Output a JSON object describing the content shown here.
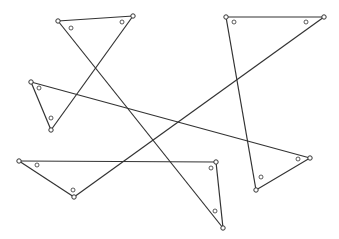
{
  "diagram": {
    "stroke_color": "#333333",
    "background": "#ffffff",
    "vertices": [
      {
        "id": "A",
        "x": 58,
        "y": 21
      },
      {
        "id": "B",
        "x": 133,
        "y": 16
      },
      {
        "id": "C",
        "x": 51,
        "y": 130
      },
      {
        "id": "D",
        "x": 31,
        "y": 82
      },
      {
        "id": "E",
        "x": 310,
        "y": 158
      },
      {
        "id": "F",
        "x": 19,
        "y": 161
      },
      {
        "id": "G",
        "x": 216,
        "y": 162
      },
      {
        "id": "H",
        "x": 74,
        "y": 197
      },
      {
        "id": "I",
        "x": 324,
        "y": 17
      },
      {
        "id": "J",
        "x": 226,
        "y": 17
      },
      {
        "id": "K",
        "x": 256,
        "y": 190
      },
      {
        "id": "L",
        "x": 223,
        "y": 228
      }
    ],
    "edges": [
      [
        "A",
        "B"
      ],
      [
        "B",
        "C"
      ],
      [
        "A",
        "L"
      ],
      [
        "D",
        "C"
      ],
      [
        "D",
        "E"
      ],
      [
        "F",
        "G"
      ],
      [
        "F",
        "H"
      ],
      [
        "H",
        "I"
      ],
      [
        "G",
        "L"
      ],
      [
        "J",
        "I"
      ],
      [
        "J",
        "K"
      ],
      [
        "K",
        "E"
      ]
    ],
    "angle_markers": [
      {
        "x": 71,
        "y": 28
      },
      {
        "x": 122,
        "y": 22
      },
      {
        "x": 39,
        "y": 88
      },
      {
        "x": 51,
        "y": 118
      },
      {
        "x": 37,
        "y": 165
      },
      {
        "x": 73,
        "y": 190
      },
      {
        "x": 211,
        "y": 168
      },
      {
        "x": 215,
        "y": 211
      },
      {
        "x": 234,
        "y": 22
      },
      {
        "x": 306,
        "y": 22
      },
      {
        "x": 261,
        "y": 177
      },
      {
        "x": 298,
        "y": 159
      }
    ]
  }
}
